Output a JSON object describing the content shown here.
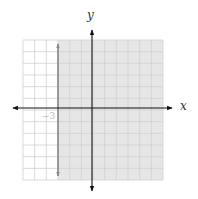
{
  "chart_data": {
    "type": "inequality-graph",
    "title": "",
    "inequality": "x > -3",
    "boundary": {
      "x": -3,
      "style": "solid",
      "orientation": "vertical"
    },
    "shaded_region": "right of x = -3",
    "xlabel": "x",
    "ylabel": "y",
    "xlim": [
      -6,
      6
    ],
    "ylim": [
      -6,
      6
    ],
    "grid": true,
    "grid_step": 1,
    "annotations": [
      {
        "text": "-3",
        "x": -3,
        "y": -1
      }
    ]
  },
  "axes": {
    "x_label": "x",
    "y_label": "y"
  },
  "annotation_label": "−3",
  "colors": {
    "shade": "#e6e6e6",
    "grid": "#cfcfcf",
    "axis": "#111111",
    "boundary": "#8a8a8a"
  }
}
